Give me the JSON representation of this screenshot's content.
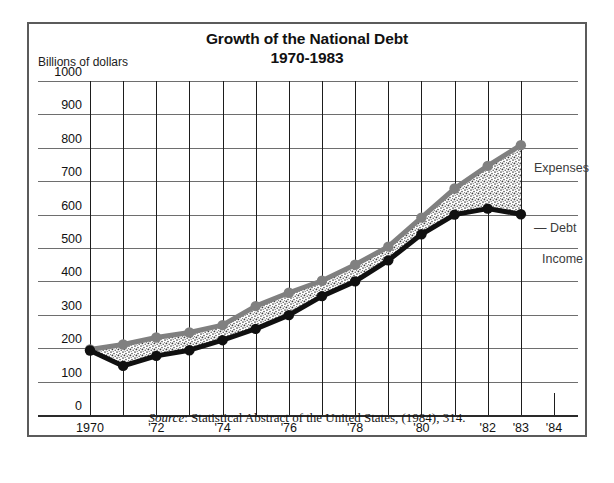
{
  "figure": {
    "title_line1": "Growth of the National Debt",
    "title_line2": "1970-1983",
    "y_axis_title": "Billions of dollars",
    "source_label": "Source",
    "source_text": ": Statistical Abstract of the United States, (1984), 314."
  },
  "legend": {
    "expenses_label": "Expenses",
    "debt_label": "— Debt",
    "income_label": "Income"
  },
  "colors": {
    "expenses_line": "#808080",
    "income_line": "#101010",
    "debt_fill": "#d9d9d9",
    "grid": "#6e6e6e",
    "frame": "#5b5b5b",
    "text": "#111111"
  },
  "chart_data": {
    "type": "area",
    "title": "Growth of the National Debt 1970-1983",
    "subtitle": "1970-1983",
    "xlabel": "",
    "ylabel": "Billions of dollars",
    "ylim": [
      0,
      1000
    ],
    "xlim": [
      1970,
      1984
    ],
    "ytick_values": [
      0,
      100,
      200,
      300,
      400,
      500,
      600,
      700,
      800,
      900,
      1000
    ],
    "ytick_labels": [
      "0",
      "100",
      "200",
      "300",
      "400",
      "500",
      "600",
      "700",
      "800",
      "900",
      "1000"
    ],
    "xtick_values": [
      1970,
      1971,
      1972,
      1973,
      1974,
      1975,
      1976,
      1977,
      1978,
      1979,
      1980,
      1981,
      1982,
      1983,
      1984
    ],
    "xtick_labels": [
      "1970",
      "",
      "'72",
      "",
      "'74",
      "",
      "'76",
      "",
      "'78",
      "",
      "'80",
      "",
      "'82",
      "'83",
      "'84"
    ],
    "grid": true,
    "legend_position": "right",
    "x": [
      1970,
      1971,
      1972,
      1973,
      1974,
      1975,
      1976,
      1977,
      1978,
      1979,
      1980,
      1981,
      1982,
      1983
    ],
    "series": [
      {
        "name": "Expenses",
        "color": "#808080",
        "values": [
          196,
          211,
          232,
          247,
          269,
          326,
          366,
          402,
          450,
          504,
          591,
          678,
          746,
          808
        ]
      },
      {
        "name": "Income",
        "color": "#101010",
        "values": [
          193,
          147,
          177,
          194,
          224,
          258,
          299,
          356,
          400,
          463,
          541,
          600,
          618,
          601
        ]
      }
    ],
    "fill_between": {
      "name": "Debt",
      "upper_series": "Expenses",
      "lower_series": "Income",
      "pattern": "stipple"
    }
  }
}
